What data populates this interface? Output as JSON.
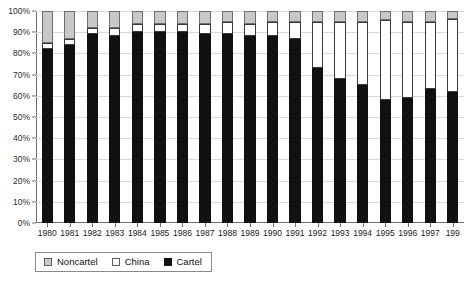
{
  "chart_data": {
    "type": "bar",
    "stacked": true,
    "stack_mode": "percent",
    "title": "",
    "subtitle": "",
    "xlabel": "",
    "ylabel": "",
    "ylim": [
      0,
      100
    ],
    "y_tick_labels": [
      "0%",
      "10%",
      "20%",
      "30%",
      "40%",
      "50%",
      "60%",
      "70%",
      "80%",
      "90%",
      "100%"
    ],
    "y_tick_values": [
      0,
      10,
      20,
      30,
      40,
      50,
      60,
      70,
      80,
      90,
      100
    ],
    "grid": true,
    "grid_axis": "y",
    "legend_position": "bottom-left",
    "categories": [
      "1980",
      "1981",
      "1982",
      "1983",
      "1984",
      "1985",
      "1986",
      "1987",
      "1988",
      "1989",
      "1990",
      "1991",
      "1992",
      "1993",
      "1994",
      "1995",
      "1996",
      "1997",
      "199"
    ],
    "last_category_truncated": true,
    "series": [
      {
        "name": "Cartel",
        "color": "#111111",
        "values": [
          82,
          84,
          89,
          88,
          90,
          90,
          90,
          89,
          89,
          88,
          88,
          87,
          73,
          68,
          65,
          58,
          59,
          63,
          62
        ]
      },
      {
        "name": "China",
        "color": "#ffffff",
        "values": [
          3,
          3,
          3,
          4,
          4,
          4,
          4,
          5,
          6,
          6,
          7,
          8,
          22,
          27,
          30,
          38,
          36,
          32,
          34
        ]
      },
      {
        "name": "Noncartel",
        "color": "#c8c8c8",
        "values": [
          15,
          13,
          8,
          8,
          6,
          6,
          6,
          6,
          5,
          6,
          5,
          5,
          5,
          5,
          5,
          4,
          5,
          5,
          4
        ]
      }
    ]
  },
  "legend": {
    "items": [
      {
        "label": "Noncartel",
        "swatch": "noncartel"
      },
      {
        "label": "China",
        "swatch": "china"
      },
      {
        "label": "Cartel",
        "swatch": "cartel"
      }
    ]
  }
}
